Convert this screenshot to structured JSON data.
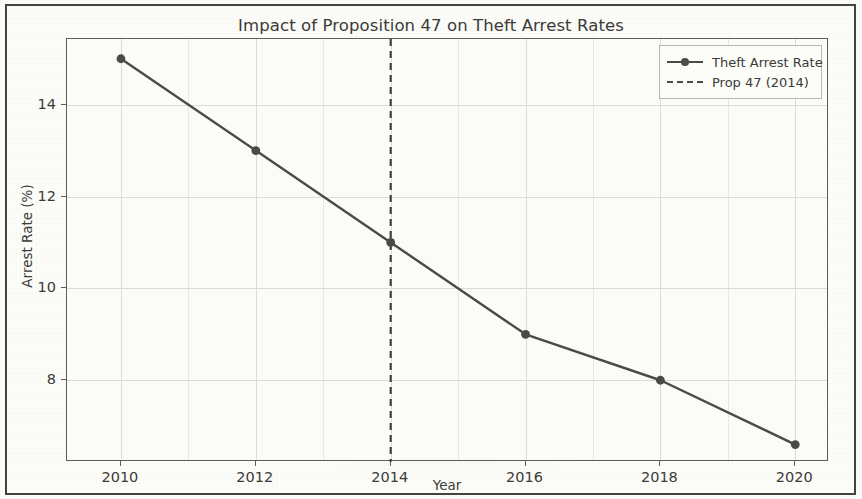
{
  "chart_data": {
    "type": "line",
    "title": "Impact of Proposition 47 on Theft Arrest Rates",
    "xlabel": "Year",
    "ylabel": "Arrest Rate (%)",
    "x": [
      2010,
      2012,
      2014,
      2016,
      2018,
      2020
    ],
    "series": [
      {
        "name": "Theft Arrest Rate",
        "values": [
          15.0,
          13.0,
          11.0,
          9.0,
          8.0,
          6.6
        ],
        "color": "#4a4a46",
        "marker": "circle",
        "linestyle": "solid"
      }
    ],
    "annotations": [
      {
        "name": "Prop 47 (2014)",
        "type": "vertical-line",
        "x": 2014,
        "linestyle": "dashed",
        "color": "#3b3b38"
      }
    ],
    "xlim": [
      2009.2,
      2020.5
    ],
    "ylim": [
      6.22,
      15.43
    ],
    "xticks": [
      "2010",
      "2012",
      "2014",
      "2016",
      "2018",
      "2020"
    ],
    "yticks": [
      "8",
      "10",
      "12",
      "14"
    ],
    "grid": true,
    "legend": {
      "position": "upper right",
      "entries": [
        {
          "label": "Theft Arrest Rate",
          "key": "line-marker-key"
        },
        {
          "label": "Prop 47 (2014)",
          "key": "dashed-line-key"
        }
      ]
    },
    "background_color": "#fbfbf7",
    "gridline_color": "#dcdcd4",
    "axis_color": "#5d5d58"
  }
}
